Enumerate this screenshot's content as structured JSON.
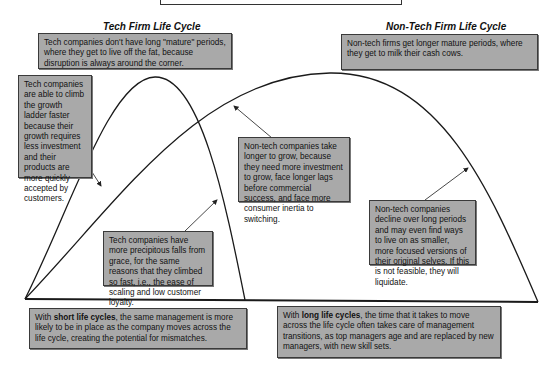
{
  "titles": {
    "tech": "Tech Firm Life Cycle",
    "nontech": "Non-Tech Firm Life Cycle"
  },
  "boxes": {
    "tech_mature": "Tech companies don't have long \"mature\" periods, where they get to live off the fat, because disruption is always around the corner.",
    "nontech_mature": "Non-tech firms get longer mature periods, where they get to milk their cash cows.",
    "tech_growth": "Tech companies are able to climb the growth ladder faster because their growth requires less investment and their products are more quickly accepted by customers.",
    "nontech_growth": "Non-tech companies take longer to grow, because they need more investment to grow, face longer lags before commercial success, and face more consumer inertia to switching.",
    "tech_decline": "Tech companies have more precipitous falls from grace, for the same reasons that they climbed so fast, i.e., the ease of scaling and low customer loyalty.",
    "nontech_decline": "Non-tech companies decline over long periods and may even find ways to live on as smaller, more focused versions of their original selves. If this is not feasible, they will liquidate.",
    "short_prefix": "With ",
    "short_bold": "short life cycles",
    "short_rest": ", the same management is more likely to be in place as the company moves across the life cycle, creating the potential for mismatches.",
    "long_prefix": "With ",
    "long_bold": "long life cycles",
    "long_rest": ", the time that it takes to move across the life cycle often takes care of management transitions, as top managers age and are replaced by new managers, with new skill sets."
  },
  "colors": {
    "box_fill": "#a9a9a9",
    "box_border": "#3a3a3a",
    "curve": "#1a1a1a"
  }
}
